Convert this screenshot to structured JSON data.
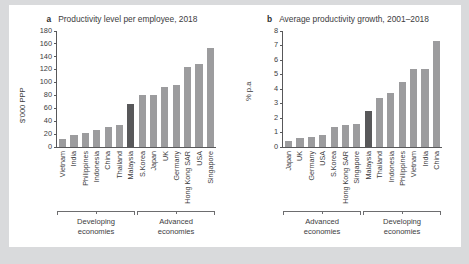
{
  "figure": {
    "background_color": "#d9dadc",
    "panel_color": "#ffffff",
    "bar_color": "#9c9c9e",
    "highlight_color": "#58585a"
  },
  "chart_data": [
    {
      "type": "bar",
      "panel_letter": "a",
      "title": "Productivity level per employee, 2018",
      "xlabel": "",
      "ylabel": "$'000 PPP",
      "ylim": [
        0,
        180
      ],
      "yticks": [
        0,
        20,
        40,
        60,
        80,
        100,
        120,
        140,
        160,
        180
      ],
      "grid": false,
      "legend": "none",
      "categories": [
        "Vietnam",
        "India",
        "Philippines",
        "Indonesia",
        "China",
        "Thailand",
        "Malaysia",
        "S.Korea",
        "Japan",
        "UK",
        "Germany",
        "Hong Kong SAR",
        "USA",
        "Singapore"
      ],
      "values": [
        13,
        19,
        22,
        26,
        31,
        34,
        67,
        80,
        80,
        93,
        97,
        124,
        129,
        153
      ],
      "highlight_category": "Malaysia",
      "groups": [
        {
          "label": "Developing\neconomies",
          "label_line1": "Developing",
          "label_line2": "economies",
          "start_index": 0,
          "end_index": 6
        },
        {
          "label": "Advanced\neconomies",
          "label_line1": "Advanced",
          "label_line2": "economies",
          "start_index": 7,
          "end_index": 13
        }
      ]
    },
    {
      "type": "bar",
      "panel_letter": "b",
      "title": "Average productivity growth, 2001–2018",
      "xlabel": "",
      "ylabel": "% p.a",
      "ylim": [
        0,
        8
      ],
      "yticks": [
        0,
        1,
        2,
        3,
        4,
        5,
        6,
        7,
        8
      ],
      "grid": false,
      "legend": "none",
      "categories": [
        "Japan",
        "UK",
        "Germany",
        "USA",
        "S.Korea",
        "Hong Kong SAR",
        "Singapore",
        "Malaysia",
        "Thailand",
        "Indonesia",
        "Philippines",
        "Vietnam",
        "India",
        "China"
      ],
      "values": [
        0.4,
        0.6,
        0.7,
        0.8,
        1.4,
        1.5,
        1.6,
        2.45,
        3.4,
        3.7,
        4.5,
        5.4,
        5.4,
        7.3
      ],
      "highlight_category": "Malaysia",
      "groups": [
        {
          "label": "Advanced\neconomies",
          "label_line1": "Advanced",
          "label_line2": "economies",
          "start_index": 0,
          "end_index": 6
        },
        {
          "label": "Developing\neconomies",
          "label_line1": "Developing",
          "label_line2": "economies",
          "start_index": 7,
          "end_index": 13
        }
      ]
    }
  ]
}
